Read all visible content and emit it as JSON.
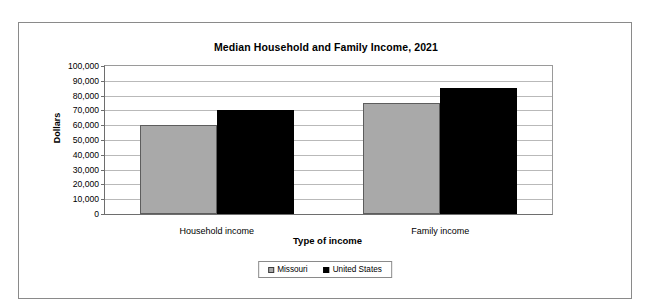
{
  "chart_data": {
    "type": "bar",
    "title": "Median Household and Family Income, 2021",
    "xlabel": "Type of income",
    "ylabel": "Dollars",
    "categories": [
      "Household income",
      "Family income"
    ],
    "series": [
      {
        "name": "Missouri",
        "color": "#a9a9a9",
        "values": [
          60000,
          75000
        ]
      },
      {
        "name": "United States",
        "color": "#000000",
        "values": [
          70000,
          85000
        ]
      }
    ],
    "ylim": [
      0,
      100000
    ],
    "ytick_step": 10000,
    "ytick_labels": [
      "100,000",
      "90,000",
      "80,000",
      "70,000",
      "60,000",
      "50,000",
      "40,000",
      "30,000",
      "20,000",
      "10,000",
      "0"
    ],
    "grid": true,
    "legend_position": "bottom"
  },
  "legend": {
    "items": [
      {
        "label": "Missouri",
        "swatch": "gray-square-icon"
      },
      {
        "label": "United States",
        "swatch": "black-square-icon"
      }
    ]
  }
}
